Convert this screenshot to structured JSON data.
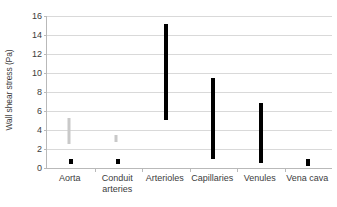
{
  "chart_data": {
    "type": "bar",
    "subtype": "floating-range-bar",
    "title": "",
    "xlabel": "",
    "ylabel": "Wall shear stress (Pa)",
    "ylim": [
      0,
      16
    ],
    "ytick_step": 2,
    "yticks": [
      0,
      2,
      4,
      6,
      8,
      10,
      12,
      14,
      16
    ],
    "ytick_labels": [
      "0",
      "2",
      "4",
      "6",
      "8",
      "10",
      "12",
      "14",
      "16"
    ],
    "grid": true,
    "grid_axis": "y",
    "legend": "none",
    "categories": [
      "Aorta",
      "Conduit arteries",
      "Arterioles",
      "Capillaries",
      "Venules",
      "Vena cava"
    ],
    "category_label_lines": [
      [
        "Aorta"
      ],
      [
        "Conduit",
        "arteries"
      ],
      [
        "Arterioles"
      ],
      [
        "Capillaries"
      ],
      [
        "Venules"
      ],
      [
        "Vena cava"
      ]
    ],
    "series": [
      {
        "name": "primary range",
        "color": "#000000",
        "ranges": [
          {
            "category": "Aorta",
            "low": 0.4,
            "high": 1.0
          },
          {
            "category": "Conduit arteries",
            "low": 0.4,
            "high": 1.0
          },
          {
            "category": "Arterioles",
            "low": 5.0,
            "high": 15.2
          },
          {
            "category": "Capillaries",
            "low": 1.0,
            "high": 9.5
          },
          {
            "category": "Venules",
            "low": 0.5,
            "high": 6.8
          },
          {
            "category": "Vena cava",
            "low": 0.2,
            "high": 1.0
          }
        ]
      },
      {
        "name": "secondary range",
        "color": "#c9c9c9",
        "ranges": [
          {
            "category": "Aorta",
            "low": 2.5,
            "high": 5.3
          },
          {
            "category": "Conduit arteries",
            "low": 2.7,
            "high": 3.5
          }
        ]
      }
    ]
  },
  "axis": {
    "y_title": "Wall shear stress (Pa)",
    "y_tick_0": "0",
    "y_tick_1": "2",
    "y_tick_2": "4",
    "y_tick_3": "6",
    "y_tick_4": "8",
    "y_tick_5": "10",
    "y_tick_6": "12",
    "y_tick_7": "14",
    "y_tick_8": "16"
  },
  "categories": {
    "c0_l1": "Aorta",
    "c1_l1": "Conduit",
    "c1_l2": "arteries",
    "c2_l1": "Arterioles",
    "c3_l1": "Capillaries",
    "c4_l1": "Venules",
    "c5_l1": "Vena cava"
  },
  "colors": {
    "bar_primary": "#000000",
    "bar_secondary": "#c9c9c9",
    "gridline": "#d9d9d9",
    "axis": "#b9b9b9",
    "text": "#3c3c3c",
    "background": "#ffffff"
  }
}
